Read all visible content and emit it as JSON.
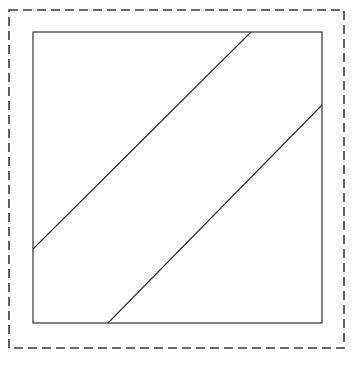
{
  "figure": {
    "canvas": {
      "width": 360,
      "height": 366,
      "background_color": "#ffffff"
    },
    "dashed_border": {
      "name": "dashed bounding box",
      "x": 9,
      "y": 10,
      "width": 335,
      "height": 338,
      "stroke_color": "#3b3b3b",
      "stroke_width": 1.6,
      "dash_length": 9,
      "gap_length": 5,
      "fill": "none"
    },
    "square": {
      "name": "solid square outline",
      "x": 33,
      "y": 32,
      "width": 289,
      "height": 291,
      "stroke_color": "#333333",
      "stroke_width": 1.2,
      "fill": "none"
    },
    "diagonals": [
      {
        "name": "upper diagonal line",
        "x1": 33,
        "y1": 249,
        "x2": 251,
        "y2": 32,
        "stroke_color": "#333333",
        "stroke_width": 1.2
      },
      {
        "name": "lower diagonal line",
        "x1": 108,
        "y1": 323,
        "x2": 322,
        "y2": 105,
        "stroke_color": "#333333",
        "stroke_width": 1.2
      }
    ]
  }
}
